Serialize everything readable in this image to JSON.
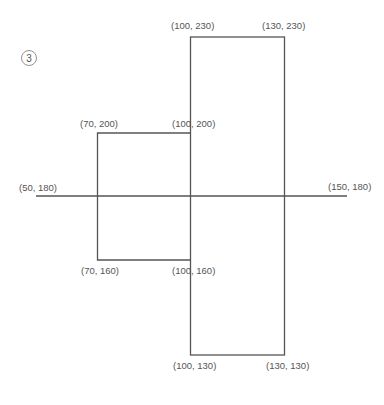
{
  "figure": {
    "number_label": "3",
    "line_color": "#555555",
    "text_color": "#555555"
  },
  "shapes": {
    "tall_rectangle": {
      "corners": [
        "(100, 230)",
        "(130, 230)",
        "(100, 130)",
        "(130, 130)"
      ]
    },
    "small_rectangle": {
      "corners": [
        "(70, 200)",
        "(100, 200)",
        "(70, 160)",
        "(100, 160)"
      ]
    },
    "horizontal_line": {
      "endpoints": [
        "(50, 180)",
        "(150, 180)"
      ]
    }
  },
  "labels": {
    "p_100_230": "(100, 230)",
    "p_130_230": "(130, 230)",
    "p_70_200": "(70, 200)",
    "p_100_200": "(100, 200)",
    "p_50_180": "(50, 180)",
    "p_150_180": "(150, 180)",
    "p_70_160": "(70, 160)",
    "p_100_160": "(100, 160)",
    "p_100_130": "(100, 130)",
    "p_130_130": "(130, 130)"
  }
}
